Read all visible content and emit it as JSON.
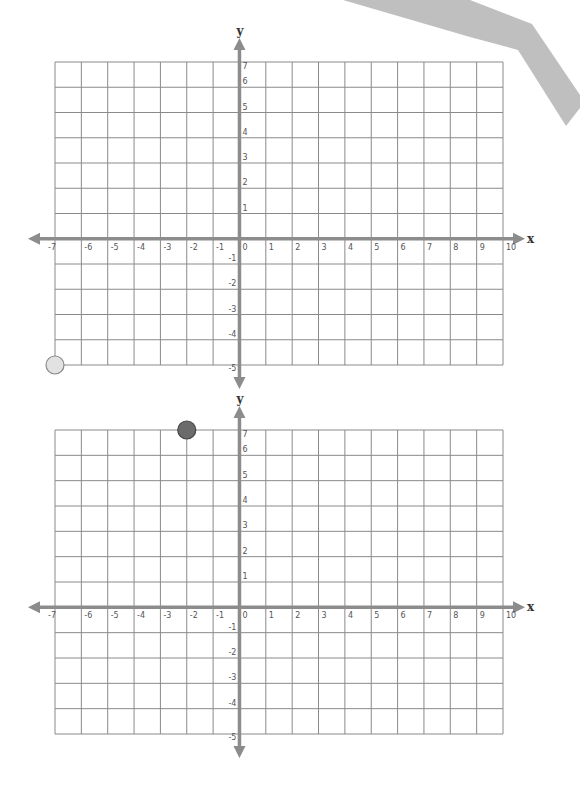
{
  "worksheet": {
    "decorations": {
      "shadow_color": "#b8b8b8"
    },
    "graphs": [
      {
        "id": "graph-top",
        "x_axis_label": "x",
        "y_axis_label": "y",
        "x_range": [
          -7,
          10
        ],
        "y_range": [
          -5,
          7
        ],
        "x_tick_labels": [
          "-7",
          "-6",
          "-5",
          "-4",
          "-3",
          "-2",
          "-1",
          "0",
          "1",
          "2",
          "3",
          "4",
          "5",
          "6",
          "7",
          "8",
          "9",
          "10"
        ],
        "y_tick_labels": [
          "7",
          "6",
          "5",
          "4",
          "3",
          "2",
          "1",
          "-1",
          "-2",
          "-3",
          "-4",
          "-5"
        ],
        "points": [
          {
            "x": -7,
            "y": -5,
            "fill": "#e2e2e2",
            "stroke": "#8a8a8a",
            "name": "light-point"
          }
        ]
      },
      {
        "id": "graph-bottom",
        "x_axis_label": "x",
        "y_axis_label": "y",
        "x_range": [
          -7,
          10
        ],
        "y_range": [
          -5,
          7
        ],
        "x_tick_labels": [
          "-7",
          "-6",
          "-5",
          "-4",
          "-3",
          "-2",
          "-1",
          "0",
          "1",
          "2",
          "3",
          "4",
          "5",
          "6",
          "7",
          "8",
          "9",
          "10"
        ],
        "y_tick_labels": [
          "7",
          "6",
          "5",
          "4",
          "3",
          "2",
          "1",
          "-1",
          "-2",
          "-3",
          "-4",
          "-5"
        ],
        "points": [
          {
            "x": -2,
            "y": 7,
            "fill": "#6b6b6b",
            "stroke": "#444444",
            "name": "dark-point"
          }
        ]
      }
    ]
  }
}
